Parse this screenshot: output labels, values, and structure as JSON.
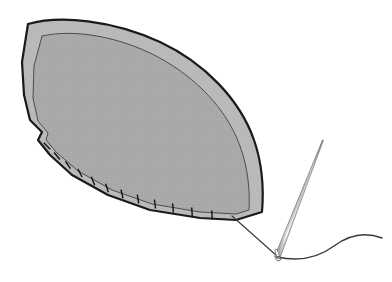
{
  "illustration": {
    "title": "Sewing a curved fabric panel with needle and thread",
    "type": "line-drawing",
    "background_color": "#ffffff",
    "canvas": {
      "width": 392,
      "height": 282
    }
  },
  "colors": {
    "outline_dark": "#1a1a1a",
    "outline_medium": "#4a4a4a",
    "panel_band_fill": "#b9b9b9",
    "panel_inner_fill": "#a9a9a9",
    "needle_light": "#f2f2f2",
    "needle_edge": "#6b6b6b",
    "thread": "#3a3a3a",
    "stitch": "#111111"
  },
  "parts": {
    "panel": {
      "name": "fabric-panel",
      "description": "Leaf / lens shaped fabric panel seen in perspective, with an outer hemmed band and an inner textured field",
      "outer_outline_width": 2.2,
      "inner_outline_width": 0.9,
      "outer_path": "M 28 24 C 60 15 112 20 160 42 C 205 63 240 100 254 140 C 262 163 264 188 262 212 L 236 220 L 200 218 L 150 210 L 108 195 L 72 175 L 50 155 L 38 140 L 42 132 L 30 120 L 24 95 L 22 62 Z",
      "inner_path": "M 42 36 C 74 29 118 36 158 57 C 197 78 227 110 240 146 C 248 168 250 190 249 210 L 236 214 L 200 212 L 152 204 L 112 190 L 78 171 L 56 152 L 46 140 L 48 133 L 38 121 L 33 98 L 34 66 Z",
      "texture": "fine stipple / halftone dots"
    },
    "stitches": {
      "name": "stitch-marks",
      "count": 12,
      "description": "Short tick marks crossing the lower seam edge",
      "length": 9,
      "width": 1.4,
      "points": [
        {
          "x": 47,
          "y": 146,
          "angle": -46
        },
        {
          "x": 57,
          "y": 156,
          "angle": -40
        },
        {
          "x": 68,
          "y": 165,
          "angle": -34
        },
        {
          "x": 80,
          "y": 173,
          "angle": -28
        },
        {
          "x": 93,
          "y": 181,
          "angle": -22
        },
        {
          "x": 107,
          "y": 188,
          "angle": -17
        },
        {
          "x": 122,
          "y": 194,
          "angle": -13
        },
        {
          "x": 138,
          "y": 199,
          "angle": -9
        },
        {
          "x": 155,
          "y": 204,
          "angle": -7
        },
        {
          "x": 173,
          "y": 208,
          "angle": -5
        },
        {
          "x": 192,
          "y": 212,
          "angle": -4
        },
        {
          "x": 212,
          "y": 215,
          "angle": -3
        }
      ]
    },
    "needle": {
      "name": "sewing-needle",
      "description": "Long straight needle angled from lower-left eye up to upper-right point",
      "tip": {
        "x": 323,
        "y": 140
      },
      "eye_center": {
        "x": 277,
        "y": 256
      },
      "shaft_width_at_eye": 5.5,
      "shaft_width_at_tip": 0.8,
      "eye": {
        "rx": 3.0,
        "ry": 4.6,
        "angle": -22
      }
    },
    "thread": {
      "name": "thread",
      "description": "Thread running from the panel seam corner into the needle eye, then curving away to the right",
      "width": 1.2,
      "leading_path": "M 232 216 L 277 256",
      "trailing_path": "M 277 257 C 300 262 318 258 334 246 C 350 234 366 232 382 238"
    }
  }
}
